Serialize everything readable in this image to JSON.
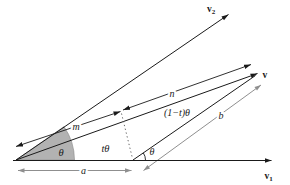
{
  "figure": {
    "type": "vector-interpolation-diagram",
    "background": "#ffffff",
    "palette": {
      "line": "#1a1a1a",
      "measure_gray": "#8f8f8f",
      "sector_fill": "#b2b2b2"
    },
    "vectors": {
      "v1": {
        "base": "v",
        "sub": "1"
      },
      "v2": {
        "base": "v",
        "sub": "2"
      },
      "v": {
        "base": "v"
      }
    },
    "angles": {
      "theta_origin": "θ",
      "t_theta": "tθ",
      "one_minus_t_theta": "(1−t)θ",
      "theta_foot": "θ"
    },
    "segments": {
      "m": "m",
      "n": "n",
      "a": "a",
      "b": "b"
    }
  }
}
